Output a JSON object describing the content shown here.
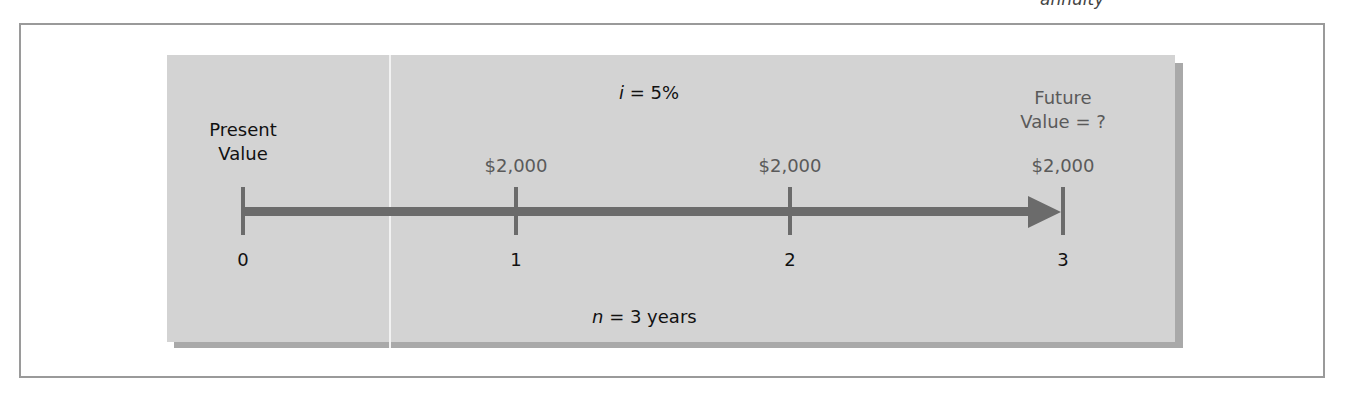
{
  "header": {
    "cutoff_text": "annuity"
  },
  "diagram": {
    "interest_rate_label": {
      "var": "i",
      "rest": " = 5%"
    },
    "periods_label": {
      "var": "n",
      "rest": " = 3 years"
    },
    "present_value_label": [
      "Present",
      "Value"
    ],
    "future_value_label": [
      "Future",
      "Value = ?"
    ],
    "cash_flows": [
      {
        "period": "1",
        "amount": "$2,000"
      },
      {
        "period": "2",
        "amount": "$2,000"
      },
      {
        "period": "3",
        "amount": "$2,000"
      }
    ],
    "ticks": [
      "0",
      "1",
      "2",
      "3"
    ],
    "colors": {
      "panel": "#d3d3d3",
      "shadow": "#a9a9a9",
      "timeline": "#6b6b6b",
      "amount_text": "#5a5a5a"
    }
  }
}
